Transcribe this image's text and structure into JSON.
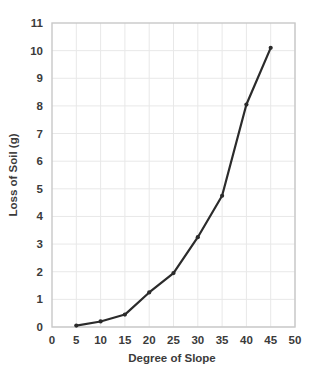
{
  "chart_data": {
    "type": "line",
    "title": "",
    "xlabel": "Degree of Slope",
    "ylabel": "Loss of Soil (g)",
    "xlim": [
      0,
      50
    ],
    "ylim": [
      0,
      11
    ],
    "xticks": [
      0,
      5,
      10,
      15,
      20,
      25,
      30,
      35,
      40,
      45,
      50
    ],
    "yticks": [
      0,
      1,
      2,
      3,
      4,
      5,
      6,
      7,
      8,
      9,
      10,
      11
    ],
    "grid": true,
    "legend": "none",
    "series": [
      {
        "name": "Loss of Soil",
        "x": [
          5,
          10,
          15,
          20,
          25,
          30,
          35,
          40,
          45
        ],
        "values": [
          0.05,
          0.2,
          0.45,
          1.25,
          1.95,
          3.25,
          4.75,
          8.05,
          10.1
        ],
        "color": "#2b2b2b",
        "marker": "circle"
      }
    ]
  },
  "style": {
    "background": "#ffffff",
    "grid_color": "#e8e8e8",
    "frame_color": "#c8c8c8",
    "text_color": "#3b3b3b",
    "line_color": "#2b2b2b"
  },
  "labels": {
    "x_tick_0": "0",
    "x_tick_1": "5",
    "x_tick_2": "10",
    "x_tick_3": "15",
    "x_tick_4": "20",
    "x_tick_5": "25",
    "x_tick_6": "30",
    "x_tick_7": "35",
    "x_tick_8": "40",
    "x_tick_9": "45",
    "x_tick_10": "50",
    "y_tick_0": "0",
    "y_tick_1": "1",
    "y_tick_2": "2",
    "y_tick_3": "3",
    "y_tick_4": "4",
    "y_tick_5": "5",
    "y_tick_6": "6",
    "y_tick_7": "7",
    "y_tick_8": "8",
    "y_tick_9": "9",
    "y_tick_10": "10",
    "y_tick_11": "11"
  }
}
